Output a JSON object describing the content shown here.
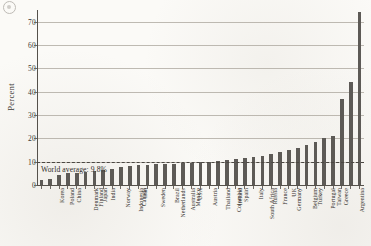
{
  "figure": {
    "corner_mark": "circular-page-mark"
  },
  "chart_data": {
    "type": "bar",
    "title": "",
    "xlabel": "",
    "ylabel": "Percent",
    "ylim": [
      0,
      75
    ],
    "yticks": [
      0,
      10,
      20,
      30,
      40,
      50,
      60,
      70
    ],
    "ytick_labels": [
      "0",
      "10",
      "20",
      "30",
      "40",
      "50",
      "60",
      "70"
    ],
    "grid": true,
    "legend": null,
    "bar_color": "#5d5a56",
    "categories": [
      "Korea",
      "Poland",
      "China",
      "Denmark",
      "Finland",
      "Japan",
      "India",
      "Norway",
      "Indonesia",
      "Canada",
      "Iran",
      "Sweden",
      "Netherlands",
      "Brazil",
      "Australia",
      "Mexico",
      "USA",
      "Austria",
      "Thailand",
      "Colombia",
      "Ireland",
      "Spain",
      "South Africa",
      "Italy",
      "Russia",
      "France",
      "Germany",
      "UK",
      "Belgium",
      "Turkey",
      "Portugal",
      "Taiwan",
      "Greece",
      "Argentina",
      "Saudi Arabia",
      "Venezuela",
      "UAE"
    ],
    "values": [
      2.0,
      2.6,
      4.2,
      5.0,
      5.2,
      5.6,
      5.8,
      6.6,
      7.0,
      7.6,
      8.0,
      8.4,
      8.6,
      8.8,
      9.0,
      9.2,
      9.4,
      9.6,
      9.8,
      10.0,
      10.2,
      10.6,
      11.0,
      11.6,
      12.0,
      12.6,
      13.4,
      14.2,
      15.0,
      16.0,
      17.2,
      18.6,
      20.0,
      21.0,
      37.0,
      44.0,
      74.0
    ],
    "reference_line": {
      "value": 9.8,
      "label": "World average: 9.8%",
      "style": "dashed"
    }
  }
}
